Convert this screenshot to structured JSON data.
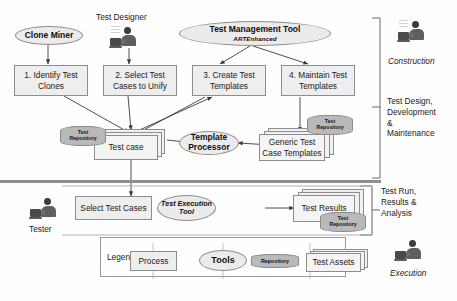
{
  "diagram": {
    "colors": {
      "process_fill": "#eeeeee",
      "tool_fill": "#ebebeb",
      "repository_fill": "#b9b9b9",
      "asset_fill": "#f1f1f1",
      "stroke": "#8d8d8d",
      "divider": "#8f8f8f"
    }
  },
  "actors": {
    "test_designer_label": "Test Designer",
    "tester_label": "Tester"
  },
  "tools": {
    "clone_miner": "Clone Miner",
    "test_management_tool": "Test Management Tool",
    "test_management_tool_sub": "ARTEnhanced",
    "template_processor_line1": "Template",
    "template_processor_line2": "Processor",
    "test_execution_tool_line1": "Test Execution",
    "test_execution_tool_line2": "Tool"
  },
  "processes": [
    {
      "id": "p1",
      "line1": "1. Identify Test",
      "line2": "Clones"
    },
    {
      "id": "p2",
      "line1": "2. Select Test",
      "line2": "Cases to Unify"
    },
    {
      "id": "p3",
      "line1": "3. Create Test",
      "line2": "Templates"
    },
    {
      "id": "p4",
      "line1": "4. Maintain Test",
      "line2": "Templates"
    },
    {
      "id": "p5",
      "line1": "Select Test Cases",
      "line2": ""
    }
  ],
  "assets": {
    "test_case": "Test case",
    "generic_templates_line1": "Generic Test",
    "generic_templates_line2": "Case Templates",
    "test_results": "Test Results"
  },
  "repositories": {
    "repo_line1": "Test",
    "repo_line2": "Repository"
  },
  "phases": {
    "construction": "Construction",
    "design_dev_maint": "Test Design,\nDevelopment\n&\nMaintenance",
    "design_dev_maint_lines": [
      "Test Design,",
      "Development",
      "&",
      "Maintenance"
    ],
    "test_run_lines": [
      "Test Run,",
      "Results &",
      "Analysis"
    ],
    "execution": "Execution"
  },
  "legend": {
    "title": "Legend",
    "items": [
      {
        "label": "Process",
        "shape": "rectangle"
      },
      {
        "label": "Tools",
        "shape": "ellipse"
      },
      {
        "label": "Repository",
        "shape": "cylinder"
      },
      {
        "label": "Test Assets",
        "shape": "document-stack"
      }
    ]
  }
}
